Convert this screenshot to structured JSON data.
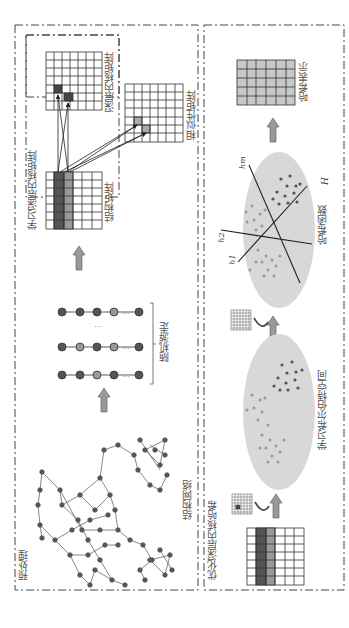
{
  "sections": {
    "preprocess": {
      "label": "预处理"
    },
    "optimize": {
      "label": "优化深层内核哈希"
    },
    "learn_kernel_box": {
      "label": "学习深层内核矩阵"
    }
  },
  "labels": {
    "structure_network": "结构网络",
    "random_walk": "随机游走",
    "structure_matrix_top": "结构矩阵",
    "deep_kernel_matrix": "深层内核矩阵",
    "similarity_matrix": "相似性矩阵",
    "hilbert_space": "学习希尔伯特空间",
    "hash_functions": "哈希函数",
    "hash_representation": "哈希表示",
    "H": "H",
    "h1": "h1",
    "h2": "h2",
    "hm": "hm",
    "ellipsis": "…"
  },
  "colors": {
    "dark_node": "#555555",
    "light_node": "#9a9a9a",
    "ellipse_fill": "#d8d8d8",
    "arrow_fill": "#999999",
    "grid_line": "#333333",
    "hash_cell": "#c8c8c8",
    "frame": "#444444"
  },
  "random_walks": [
    [
      "dark",
      "dark",
      "dark",
      "light",
      "dark"
    ],
    [
      "dark",
      "light",
      "dark",
      "light",
      "dark"
    ],
    [
      "dark",
      "dark",
      "light",
      "dark",
      "dark"
    ]
  ]
}
